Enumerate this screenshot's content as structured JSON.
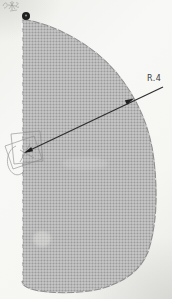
{
  "figure": {
    "type": "technical-sketch-scan",
    "dimension": {
      "radius_label": "R.4"
    },
    "colors": {
      "paper": "#f6f6f3",
      "region_fill": "#b4b4b4",
      "outline": "#8f8f8f",
      "outline_dash": "#efefec",
      "centerline_dash": "#f8f8f6",
      "leader_line": "#2e2e2e",
      "arrowhead": "#1f1f1f",
      "point_marker": "#1f1f1f",
      "pencil": "#8a8a8a",
      "label_text": "#3c3c3c"
    }
  }
}
